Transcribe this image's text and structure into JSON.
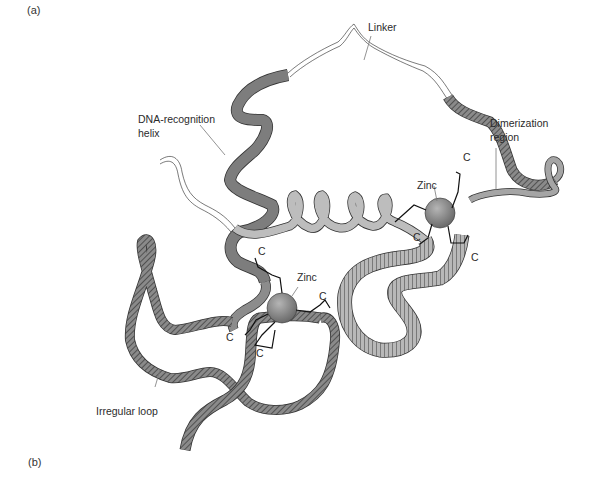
{
  "figure": {
    "panel_labels": {
      "a": "(a)",
      "b": "(b)"
    },
    "labels": {
      "linker": "Linker",
      "dna_recognition_helix_line1": "DNA-recognition",
      "dna_recognition_helix_line2": "helix",
      "dimerization_region_line1": "Dimerization",
      "dimerization_region_line2": "region",
      "zinc_upper": "Zinc",
      "zinc_lower": "Zinc",
      "irregular_loop": "Irregular loop",
      "cysteine": "C"
    },
    "colors": {
      "ribbon_dark": "#7a7a7a",
      "ribbon_mid": "#a3a3a3",
      "ribbon_light": "#d2d2d2",
      "zinc_sphere": "#8c8c8c",
      "hatch": "#2e2e2e",
      "leader_line": "#777777"
    }
  }
}
